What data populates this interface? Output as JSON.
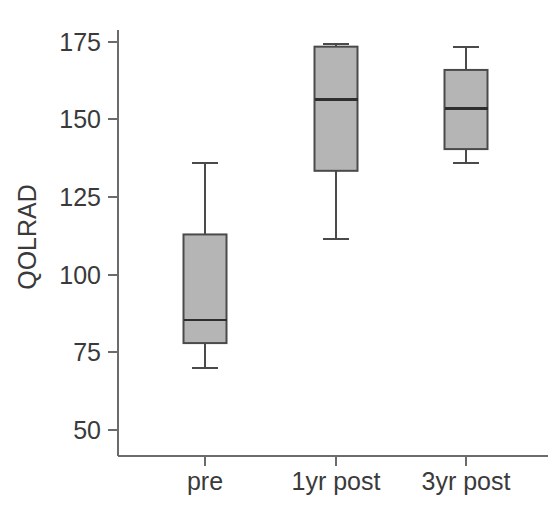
{
  "chart_data": {
    "type": "box",
    "title": "",
    "xlabel": "",
    "ylabel": "QOLRAD",
    "categories": [
      "pre",
      "1yr post",
      "3yr post"
    ],
    "ylim": [
      50,
      180
    ],
    "yticks": [
      50,
      75,
      100,
      125,
      150,
      175
    ],
    "ytick_labels": [
      "50",
      "75",
      "100",
      "125",
      "150",
      "175"
    ],
    "grid": false,
    "legend": "none",
    "boxes": [
      {
        "category": "pre",
        "whisker_low": 70,
        "q1": 78,
        "median": 85.5,
        "q3": 113,
        "whisker_high": 136
      },
      {
        "category": "1yr post",
        "whisker_low": 111.5,
        "q1": 133.5,
        "median": 156.5,
        "q3": 173.5,
        "whisker_high": 174.5
      },
      {
        "category": "3yr post",
        "whisker_low": 136,
        "q1": 140.5,
        "median": 153.5,
        "q3": 166,
        "whisker_high": 173.5
      }
    ],
    "colors": {
      "box_fill": "#b5b5b5",
      "box_stroke": "#4a4a4a",
      "median_stroke": "#2e2e2e",
      "axis_stroke": "#6b6b6b",
      "text": "#3a3a3a",
      "background": "#ffffff"
    }
  },
  "axis": {
    "y_title": "QOLRAD",
    "y_tick_labels": [
      "175",
      "150",
      "125",
      "100",
      "75",
      "50"
    ],
    "x_tick_labels": [
      "pre",
      "1yr post",
      "3yr post"
    ]
  }
}
